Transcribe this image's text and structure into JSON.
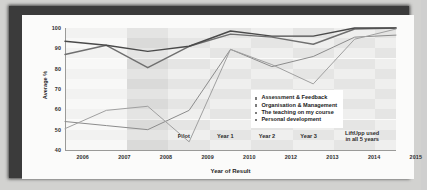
{
  "chart_data": {
    "type": "line",
    "title": "",
    "xlabel": "Year of Result",
    "ylabel": "Average %",
    "ylim": [
      40,
      100
    ],
    "yticks": [
      40,
      50,
      60,
      70,
      80,
      90,
      100
    ],
    "xticks": [
      "2006",
      "2007",
      "2008",
      "2009",
      "2010",
      "2012",
      "2013",
      "2014",
      "2015"
    ],
    "x": [
      2006,
      2007,
      2008,
      2009,
      2010,
      2012,
      2013,
      2014,
      2015
    ],
    "grid": false,
    "legend_position": "center-right",
    "series": [
      {
        "name": "Assessment & Feedback",
        "values": [
          87,
          91.5,
          80.5,
          91,
          97,
          95.5,
          92,
          99.5,
          100
        ]
      },
      {
        "name": "Organisation & Management",
        "values": [
          93.5,
          91.5,
          88.5,
          91,
          98.5,
          96,
          96,
          100,
          100
        ]
      },
      {
        "name": "The teaching on my course",
        "values": [
          54,
          52,
          50,
          59.5,
          89.5,
          81,
          86,
          95.5,
          96.5
        ]
      },
      {
        "name": "Personal development",
        "values": [
          50.5,
          59.5,
          61.5,
          44,
          89.5,
          82,
          72.5,
          94.5,
          99.5
        ]
      }
    ],
    "bands": [
      {
        "label": "Pilot",
        "sublabel": ""
      },
      {
        "label": "Year 1",
        "sublabel": ""
      },
      {
        "label": "Year 2",
        "sublabel": ""
      },
      {
        "label": "Year 3",
        "sublabel": ""
      },
      {
        "label": "LiftUpp used",
        "sublabel": "in all 5 years"
      }
    ],
    "colors": {
      "assessment_feedback": "#6f6f6f",
      "organisation_management": "#4a4a4a",
      "teaching_on_my_course": "#8c8c8c",
      "personal_development": "#a0a0a0",
      "axis": "#9a9a98",
      "text": "#1f1f1f",
      "paper": "#fbfbfa",
      "frame": "#3b3b3b"
    }
  }
}
